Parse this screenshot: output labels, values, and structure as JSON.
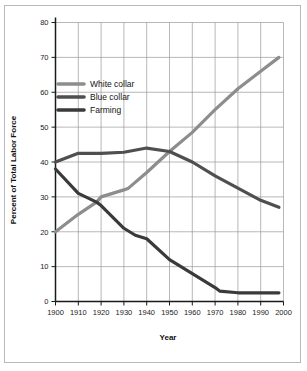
{
  "chart_data": {
    "type": "line",
    "title": "",
    "xlabel": "Year",
    "ylabel": "Percent of Total Labor Force",
    "xlim": [
      1900,
      2000
    ],
    "ylim": [
      0,
      80
    ],
    "xticks": [
      1900,
      1910,
      1920,
      1930,
      1940,
      1950,
      1960,
      1970,
      1980,
      1990,
      2000
    ],
    "yticks": [
      0,
      10,
      20,
      30,
      40,
      50,
      60,
      70,
      80
    ],
    "grid": true,
    "legend_position": "upper-left-inside",
    "series": [
      {
        "name": "White collar",
        "color": "#8d8d8d",
        "x": [
          1900,
          1910,
          1918,
          1920,
          1930,
          1932,
          1940,
          1950,
          1960,
          1970,
          1980,
          1990,
          1998
        ],
        "values": [
          20,
          25,
          28.5,
          30,
          32,
          32.5,
          37,
          43,
          48.5,
          55,
          61,
          66,
          70
        ]
      },
      {
        "name": "Blue collar",
        "color": "#4f4f4f",
        "x": [
          1900,
          1910,
          1920,
          1930,
          1940,
          1950,
          1960,
          1970,
          1980,
          1990,
          1998
        ],
        "values": [
          40,
          42.5,
          42.5,
          42.8,
          44,
          43,
          40,
          36,
          32.5,
          29,
          27
        ]
      },
      {
        "name": "Farming",
        "color": "#3a3a3a",
        "x": [
          1900,
          1910,
          1918,
          1920,
          1930,
          1935,
          1940,
          1950,
          1960,
          1970,
          1972,
          1980,
          1990,
          1998
        ],
        "values": [
          38,
          31,
          28.5,
          27.5,
          21,
          19,
          18,
          12,
          8,
          4,
          3,
          2.5,
          2.5,
          2.5
        ]
      }
    ]
  },
  "legend": {
    "items": [
      {
        "label": "White collar",
        "color": "#8d8d8d"
      },
      {
        "label": "Blue collar",
        "color": "#4f4f4f"
      },
      {
        "label": "Farming",
        "color": "#3a3a3a"
      }
    ]
  },
  "axes": {
    "x_title": "Year",
    "y_title": "Percent of Total Labor Force",
    "x_tick_labels": [
      "1900",
      "1910",
      "1920",
      "1930",
      "1940",
      "1950",
      "1960",
      "1970",
      "1980",
      "1990",
      "2000"
    ],
    "y_tick_labels": [
      "0",
      "10",
      "20",
      "30",
      "40",
      "50",
      "60",
      "70",
      "80"
    ]
  },
  "style": {
    "grid_color": "#9a9a9a",
    "axis_color": "#1a1a1a",
    "frame_color": "#b9b9b9",
    "background": "#ffffff"
  }
}
